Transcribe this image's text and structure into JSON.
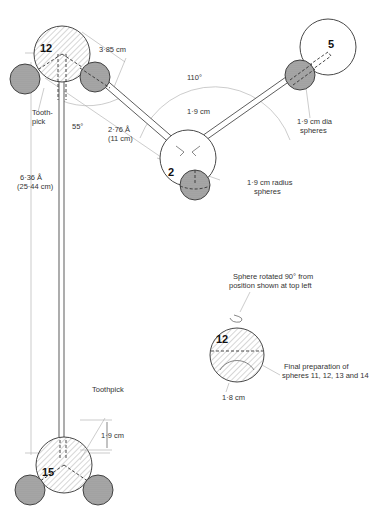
{
  "diagram": {
    "spheres": {
      "s12": {
        "label": "12"
      },
      "s2": {
        "label": "2"
      },
      "s5": {
        "label": "5"
      },
      "s15": {
        "label": "15"
      },
      "s12_detail": {
        "label": "12"
      }
    },
    "annotations": {
      "dim_385": "3·85 cm",
      "angle_110": "110°",
      "dim_19_top": "1·9 cm",
      "toothpick_top_line1": "Tooth-",
      "toothpick_top_line2": "pick",
      "angle_55": "55°",
      "bond_276_line1": "2·76 Å",
      "bond_276_line2": "(11 cm)",
      "dia_19_line1": "1·9 cm dia",
      "dia_19_line2": "spheres",
      "radius_19_line1": "1·9 cm radius",
      "radius_19_line2": "spheres",
      "bond_636_line1": "6·36 Å",
      "bond_636_line2": "(25·44 cm)",
      "toothpick_bottom": "Toothpick",
      "dim_19_bottom": "1·9 cm",
      "rotated_line1": "Sphere rotated 90° from",
      "rotated_line2": "position shown at top left",
      "final_line1": "Final preparation of",
      "final_line2": "spheres 11, 12, 13 and 14",
      "dim_18": "1·8 cm"
    }
  }
}
